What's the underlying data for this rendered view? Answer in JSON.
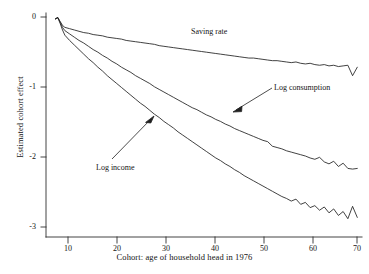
{
  "chart_data": {
    "type": "line",
    "title": "",
    "xlabel": "Cohort: age of household head in 1976",
    "ylabel": "Estimated cohort effect",
    "xlim": [
      4,
      71
    ],
    "ylim": [
      -3.25,
      0.18
    ],
    "grid": false,
    "legend_position": "inline-annotations",
    "xticks": [
      "10",
      "20",
      "30",
      "40",
      "50",
      "60",
      "70"
    ],
    "xtick_values": [
      10,
      20,
      30,
      40,
      50,
      60,
      70
    ],
    "yticks": [
      "0",
      "-1",
      "-2",
      "-3"
    ],
    "ytick_values": [
      0,
      -1,
      -2,
      -3
    ],
    "series": [
      {
        "name": "Saving rate",
        "x": [
          6,
          6.5,
          7,
          7.5,
          8,
          9,
          10,
          11,
          12,
          13,
          14,
          15,
          16,
          17,
          18,
          19,
          20,
          21,
          22,
          23,
          24,
          25,
          26,
          27,
          28,
          29,
          30,
          31,
          32,
          33,
          34,
          35,
          36,
          37,
          38,
          39,
          40,
          41,
          42,
          43,
          44,
          45,
          46,
          47,
          48,
          49,
          50,
          51,
          52,
          53,
          54,
          55,
          56,
          57,
          58,
          59,
          60,
          61,
          62,
          63,
          64,
          65,
          66,
          67,
          68,
          69,
          70
        ],
        "values": [
          0.09,
          0.11,
          0.05,
          -0.01,
          -0.04,
          -0.06,
          -0.08,
          -0.1,
          -0.12,
          -0.13,
          -0.15,
          -0.16,
          -0.17,
          -0.19,
          -0.2,
          -0.21,
          -0.22,
          -0.24,
          -0.25,
          -0.26,
          -0.27,
          -0.28,
          -0.29,
          -0.3,
          -0.32,
          -0.33,
          -0.34,
          -0.35,
          -0.36,
          -0.37,
          -0.38,
          -0.39,
          -0.4,
          -0.41,
          -0.42,
          -0.43,
          -0.44,
          -0.45,
          -0.46,
          -0.47,
          -0.48,
          -0.49,
          -0.5,
          -0.51,
          -0.51,
          -0.52,
          -0.53,
          -0.54,
          -0.55,
          -0.55,
          -0.56,
          -0.57,
          -0.58,
          -0.57,
          -0.59,
          -0.6,
          -0.59,
          -0.61,
          -0.62,
          -0.61,
          -0.63,
          -0.62,
          -0.64,
          -0.63,
          -0.62,
          -0.78,
          -0.65
        ]
      },
      {
        "name": "Log consumption",
        "x": [
          6,
          6.5,
          7,
          7.5,
          8,
          9,
          10,
          11,
          12,
          13,
          14,
          15,
          16,
          17,
          18,
          19,
          20,
          21,
          22,
          23,
          24,
          25,
          26,
          27,
          28,
          29,
          30,
          31,
          32,
          33,
          34,
          35,
          36,
          37,
          38,
          39,
          40,
          41,
          42,
          43,
          44,
          45,
          46,
          47,
          48,
          49,
          50,
          51,
          52,
          53,
          54,
          55,
          56,
          57,
          58,
          59,
          60,
          61,
          62,
          63,
          64,
          65,
          66,
          67,
          68,
          69,
          70
        ],
        "values": [
          0.09,
          0.11,
          0.04,
          -0.04,
          -0.09,
          -0.14,
          -0.19,
          -0.24,
          -0.28,
          -0.33,
          -0.38,
          -0.42,
          -0.47,
          -0.51,
          -0.56,
          -0.6,
          -0.65,
          -0.69,
          -0.73,
          -0.78,
          -0.82,
          -0.86,
          -0.9,
          -0.95,
          -0.99,
          -1.03,
          -1.07,
          -1.11,
          -1.15,
          -1.19,
          -1.23,
          -1.27,
          -1.3,
          -1.34,
          -1.38,
          -1.41,
          -1.45,
          -1.48,
          -1.52,
          -1.55,
          -1.59,
          -1.62,
          -1.65,
          -1.68,
          -1.71,
          -1.74,
          -1.77,
          -1.79,
          -1.86,
          -1.88,
          -1.9,
          -1.93,
          -1.95,
          -1.97,
          -1.99,
          -2.01,
          -2.04,
          -2.06,
          -2.03,
          -2.1,
          -2.13,
          -2.09,
          -2.17,
          -2.12,
          -2.2,
          -2.21,
          -2.2
        ]
      },
      {
        "name": "Log income",
        "x": [
          6,
          6.5,
          7,
          7.5,
          8,
          9,
          10,
          11,
          12,
          13,
          14,
          15,
          16,
          17,
          18,
          19,
          20,
          21,
          22,
          23,
          24,
          25,
          26,
          27,
          28,
          29,
          30,
          31,
          32,
          33,
          34,
          35,
          36,
          37,
          38,
          39,
          40,
          41,
          42,
          43,
          44,
          45,
          46,
          47,
          48,
          49,
          50,
          51,
          52,
          53,
          54,
          55,
          56,
          57,
          58,
          59,
          60,
          61,
          62,
          63,
          64,
          65,
          66,
          67,
          68,
          69,
          70
        ],
        "values": [
          0.09,
          0.11,
          0.02,
          -0.08,
          -0.16,
          -0.24,
          -0.31,
          -0.38,
          -0.45,
          -0.52,
          -0.58,
          -0.65,
          -0.71,
          -0.78,
          -0.84,
          -0.9,
          -0.96,
          -1.02,
          -1.08,
          -1.14,
          -1.2,
          -1.25,
          -1.31,
          -1.37,
          -1.42,
          -1.48,
          -1.53,
          -1.58,
          -1.64,
          -1.69,
          -1.74,
          -1.79,
          -1.84,
          -1.89,
          -1.94,
          -1.99,
          -2.04,
          -2.08,
          -2.13,
          -2.17,
          -2.22,
          -2.26,
          -2.31,
          -2.35,
          -2.39,
          -2.43,
          -2.47,
          -2.51,
          -2.55,
          -2.59,
          -2.63,
          -2.66,
          -2.7,
          -2.67,
          -2.75,
          -2.72,
          -2.8,
          -2.77,
          -2.84,
          -2.79,
          -2.88,
          -2.82,
          -2.92,
          -2.86,
          -2.97,
          -2.78,
          -2.95
        ]
      }
    ],
    "annotations": [
      {
        "label": "Saving rate",
        "target_series": "Saving rate"
      },
      {
        "label": "Log consumption",
        "target_series": "Log consumption",
        "arrow": true
      },
      {
        "label": "Log income",
        "target_series": "Log income",
        "arrow": true
      }
    ]
  },
  "axes": {
    "y_title": "Estimated cohort effect",
    "x_title": "Cohort: age of household head in 1976",
    "yticks": [
      {
        "label": "0"
      },
      {
        "label": "-1"
      },
      {
        "label": "-2"
      },
      {
        "label": "-3"
      }
    ],
    "xticks": [
      {
        "label": "10"
      },
      {
        "label": "20"
      },
      {
        "label": "30"
      },
      {
        "label": "40"
      },
      {
        "label": "50"
      },
      {
        "label": "60"
      },
      {
        "label": "70"
      }
    ]
  },
  "labels": {
    "saving_rate": "Saving rate",
    "log_consumption": "Log consumption",
    "log_income": "Log income"
  },
  "bottom_caption_fragment": "",
  "colors": {
    "line": "#202020",
    "axis": "#303030",
    "text": "#141414",
    "background": "#ffffff"
  }
}
